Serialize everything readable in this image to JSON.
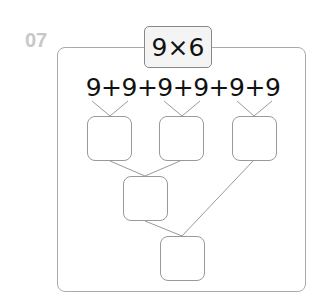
{
  "problem_number": "07",
  "title": "9×6",
  "expression": "9+9+9+9+9+9",
  "answer_boxes": [
    {
      "id": "pair1",
      "value": ""
    },
    {
      "id": "pair2",
      "value": ""
    },
    {
      "id": "pair3",
      "value": ""
    },
    {
      "id": "sum12",
      "value": ""
    },
    {
      "id": "total",
      "value": ""
    }
  ],
  "colors": {
    "number": "#c8c8c8",
    "border": "#aaaaaa",
    "title_bg": "#f4f4f4"
  }
}
